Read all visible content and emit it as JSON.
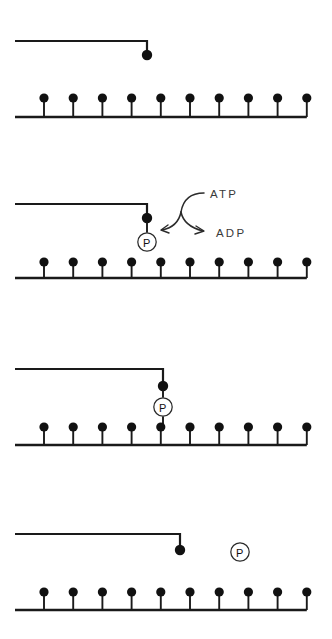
{
  "figure": {
    "name": "myosin-cross-bridge-cycle",
    "panel_count": 4,
    "width": 332,
    "height": 639,
    "background_color": "#ffffff",
    "ink_color": "#1a1a1a"
  },
  "labels": {
    "atp": "ATP",
    "adp": "ADP",
    "phosphate": "P"
  },
  "filament": {
    "name": "actin-filament",
    "tooth_count": 10,
    "first_tooth_x": 44,
    "tooth_spacing": 29.2,
    "base_start_x": 15,
    "tooth_height": 19,
    "head_radius": 4.6
  },
  "panels": [
    {
      "id": "panel-1",
      "name": "myosin-detached-unphosphorylated",
      "arm_y": 41,
      "arm_start_x": 15,
      "arm_corner_x": 147,
      "head_cy": 55,
      "head_r": 5.2,
      "has_phosphate": false,
      "phosphate_state": "none",
      "has_reaction_arrow": false,
      "filament_base_y": 117,
      "filament_dot_y": 98
    },
    {
      "id": "panel-2",
      "name": "atp-hydrolysis-phosphorylation",
      "arm_y": 204,
      "arm_start_x": 15,
      "arm_corner_x": 147,
      "head_cy": 218,
      "head_r": 5.2,
      "has_phosphate": true,
      "phosphate_state": "attached-to-head",
      "phosphate_cx": 147,
      "phosphate_cy": 242,
      "phosphate_r": 9.2,
      "has_reaction_arrow": true,
      "filament_base_y": 278,
      "filament_dot_y": 262
    },
    {
      "id": "panel-3",
      "name": "phosphorylated-head-bound-to-actin",
      "arm_y": 369,
      "arm_start_x": 15,
      "arm_corner_x": 163,
      "head_cy": 386,
      "head_r": 5.2,
      "has_phosphate": true,
      "phosphate_state": "between-head-and-filament",
      "phosphate_cx": 163,
      "phosphate_cy": 407,
      "phosphate_r": 9.2,
      "has_reaction_arrow": false,
      "filament_base_y": 445,
      "filament_dot_y": 427
    },
    {
      "id": "panel-4",
      "name": "phosphate-released-after-power-stroke",
      "arm_y": 534,
      "arm_start_x": 15,
      "arm_corner_x": 180,
      "head_cy": 550,
      "head_r": 5.2,
      "has_phosphate": true,
      "phosphate_state": "released-free",
      "phosphate_cx": 240,
      "phosphate_cy": 552,
      "phosphate_r": 9.2,
      "has_reaction_arrow": false,
      "filament_base_y": 610,
      "filament_dot_y": 592
    }
  ],
  "reaction": {
    "name": "atp-to-adp-conversion",
    "atp_label_x": 210,
    "atp_label_y": 194,
    "adp_label_x": 216,
    "adp_label_y": 233,
    "description": "curved branching arrow: ATP in, ADP out"
  }
}
